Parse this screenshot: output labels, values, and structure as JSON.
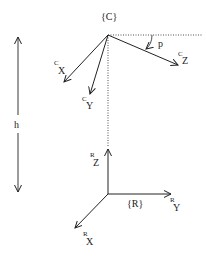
{
  "diagram": {
    "type": "coordinate-frames",
    "frames": {
      "camera": {
        "label": "{C}",
        "axes": {
          "x": {
            "superscript": "C",
            "letter": "X"
          },
          "y": {
            "superscript": "C",
            "letter": "Y"
          },
          "z": {
            "superscript": "C",
            "letter": "Z"
          }
        }
      },
      "robot": {
        "label": "{R}",
        "axes": {
          "x": {
            "superscript": "R",
            "letter": "X"
          },
          "y": {
            "superscript": "R",
            "letter": "Y"
          },
          "z": {
            "superscript": "R",
            "letter": "Z"
          }
        }
      }
    },
    "angle_label": "p",
    "height_label": "h",
    "colors": {
      "line": "#222222",
      "background": "#ffffff"
    }
  }
}
